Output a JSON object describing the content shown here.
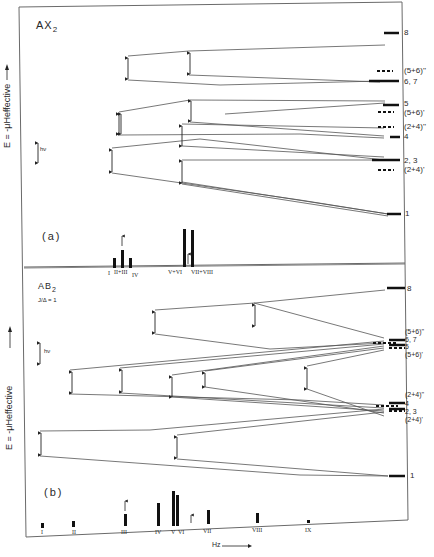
{
  "panel_a": {
    "title": "AX",
    "title_sub": "2",
    "tag": "(a)",
    "y_axis_label": "E = -μHeffective",
    "hv_label": "hν",
    "level_labels": [
      "8",
      "(5+6)''",
      "6, 7",
      "5",
      "(5+6)'",
      "(2+4)''",
      "4",
      "2, 3",
      "(2+4)'",
      "1"
    ],
    "spectrum_labels": [
      "I",
      "II+III",
      "IV",
      "V+VI",
      "VII+VIII"
    ]
  },
  "panel_b": {
    "title": "AB",
    "title_sub": "2",
    "ratio_label": "J/Δ = 1",
    "tag": "(b)",
    "y_axis_label": "E = -μHeffective",
    "hv_label": "hν",
    "level_labels": [
      "8",
      "(5+6)''",
      "6, 7",
      "5",
      "(5+6)'",
      "(2+4)''",
      "4",
      "2, 3",
      "(2+4)'",
      "1"
    ],
    "spectrum_labels": [
      "I",
      "II",
      "III",
      "IV",
      "V",
      "VI",
      "VII",
      "VIII",
      "IX"
    ]
  },
  "x_axis_label": "Hz",
  "colors": {
    "line": "#555555",
    "ink": "#1a1a1a",
    "frame": "#6a6a6a",
    "background": "#ffffff"
  }
}
